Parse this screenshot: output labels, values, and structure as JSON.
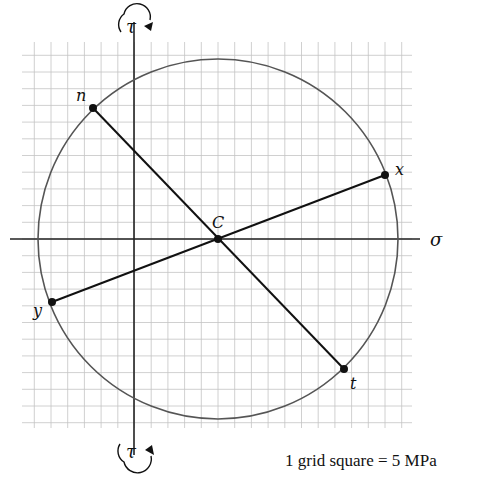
{
  "scale_note": "1 grid square = 5 MPa",
  "axes": {
    "horizontal_label": "σ",
    "vertical_label_top": "τ",
    "vertical_label_bottom": "τ",
    "top_rotation": "clockwise",
    "bottom_rotation": "counterclockwise"
  },
  "points": {
    "center": {
      "label": "C",
      "sigma_squares": 5,
      "tau_squares": 0
    },
    "x": {
      "label": "x",
      "sigma_squares": 15,
      "tau_squares": -4
    },
    "y": {
      "label": "y",
      "sigma_squares": -5,
      "tau_squares": 4
    },
    "n": {
      "label": "n",
      "sigma_squares": -2.5,
      "tau_squares": -8
    },
    "t": {
      "label": "t",
      "sigma_squares": 12.5,
      "tau_squares": 8
    }
  },
  "colors": {
    "grid": "#bdbdbd",
    "lines": "#111111",
    "circle": "#555555"
  }
}
